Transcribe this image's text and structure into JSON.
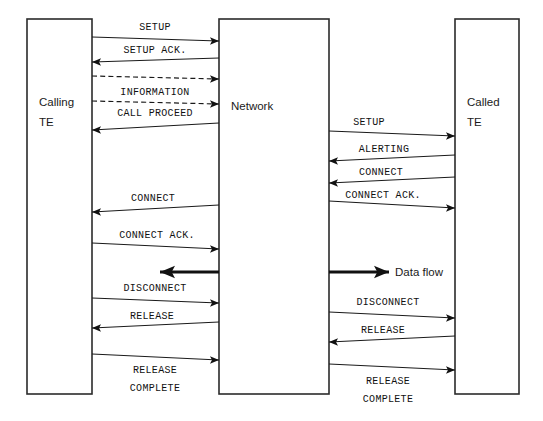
{
  "diagram": {
    "colors": {
      "line": "#1a1a1a",
      "box_stroke": "#2b2b2b",
      "background": "#ffffff",
      "bold_arrow": "#111111"
    },
    "nodes": [
      {
        "id": "calling",
        "label_line1": "Calling",
        "label_line2": "TE",
        "x": 27,
        "y": 19,
        "w": 65,
        "h": 375
      },
      {
        "id": "network",
        "label_line1": "Network",
        "label_line2": "",
        "x": 219,
        "y": 19,
        "w": 110,
        "h": 375
      },
      {
        "id": "called",
        "label_line1": "Called",
        "label_line2": "TE",
        "x": 455,
        "y": 19,
        "w": 64,
        "h": 375
      }
    ],
    "messages": [
      {
        "id": "m1",
        "label": "SETUP",
        "side": "left",
        "direction": "right",
        "style": "solid",
        "label_x": 155,
        "label_y": 30,
        "x1": 92,
        "y1": 37,
        "x2": 219,
        "y2": 41
      },
      {
        "id": "m2",
        "label": "SETUP ACK.",
        "side": "left",
        "direction": "left",
        "style": "solid",
        "label_x": 155,
        "label_y": 53,
        "x1": 219,
        "y1": 58,
        "x2": 92,
        "y2": 62
      },
      {
        "id": "m3",
        "label": "",
        "side": "left",
        "direction": "right",
        "style": "dashed",
        "label_x": 0,
        "label_y": 0,
        "x1": 92,
        "y1": 76,
        "x2": 219,
        "y2": 79
      },
      {
        "id": "m4",
        "label": "INFORMATION",
        "side": "left",
        "direction": "none",
        "style": "none",
        "label_x": 155,
        "label_y": 95,
        "x1": 0,
        "y1": 0,
        "x2": 0,
        "y2": 0
      },
      {
        "id": "m5",
        "label": "",
        "side": "left",
        "direction": "right",
        "style": "dashed",
        "label_x": 0,
        "label_y": 0,
        "x1": 92,
        "y1": 101,
        "x2": 219,
        "y2": 104
      },
      {
        "id": "m6",
        "label": "CALL PROCEED",
        "side": "left",
        "direction": "left",
        "style": "solid",
        "label_x": 155,
        "label_y": 116,
        "x1": 219,
        "y1": 123,
        "x2": 92,
        "y2": 130
      },
      {
        "id": "m7",
        "label": "SETUP",
        "side": "right",
        "direction": "right",
        "style": "solid",
        "label_x": 369,
        "label_y": 125,
        "x1": 329,
        "y1": 131,
        "x2": 455,
        "y2": 136
      },
      {
        "id": "m8",
        "label": "ALERTING",
        "side": "right",
        "direction": "left",
        "style": "solid",
        "label_x": 384,
        "label_y": 152,
        "x1": 455,
        "y1": 155,
        "x2": 329,
        "y2": 161
      },
      {
        "id": "m9",
        "label": "CONNECT",
        "side": "right",
        "direction": "left",
        "style": "solid",
        "label_x": 381,
        "label_y": 175,
        "x1": 455,
        "y1": 177,
        "x2": 329,
        "y2": 183
      },
      {
        "id": "m10",
        "label": "CONNECT",
        "side": "left",
        "direction": "left",
        "style": "solid",
        "label_x": 153,
        "label_y": 201,
        "x1": 219,
        "y1": 205,
        "x2": 92,
        "y2": 212
      },
      {
        "id": "m11",
        "label": "CONNECT ACK.",
        "side": "right",
        "direction": "right",
        "style": "solid",
        "label_x": 383,
        "label_y": 198,
        "x1": 329,
        "y1": 201,
        "x2": 455,
        "y2": 208
      },
      {
        "id": "m12",
        "label": "CONNECT ACK.",
        "side": "left",
        "direction": "right",
        "style": "solid",
        "label_x": 157,
        "label_y": 238,
        "x1": 92,
        "y1": 243,
        "x2": 219,
        "y2": 249
      },
      {
        "id": "m13",
        "label": "DISCONNECT",
        "side": "left",
        "direction": "right",
        "style": "solid",
        "label_x": 155,
        "label_y": 291,
        "x1": 92,
        "y1": 298,
        "x2": 219,
        "y2": 303
      },
      {
        "id": "m14",
        "label": "RELEASE",
        "side": "left",
        "direction": "left",
        "style": "solid",
        "label_x": 152,
        "label_y": 319,
        "x1": 219,
        "y1": 322,
        "x2": 92,
        "y2": 328
      },
      {
        "id": "m15",
        "label": "",
        "side": "left",
        "direction": "right",
        "style": "solid",
        "label_x": 0,
        "label_y": 0,
        "x1": 92,
        "y1": 354,
        "x2": 219,
        "y2": 360
      },
      {
        "id": "m16",
        "label": "RELEASE",
        "side": "left",
        "direction": "none",
        "style": "none",
        "label_x": 155,
        "label_y": 373,
        "x1": 0,
        "y1": 0,
        "x2": 0,
        "y2": 0
      },
      {
        "id": "m17",
        "label": "COMPLETE",
        "side": "left",
        "direction": "none",
        "style": "none",
        "label_x": 155,
        "label_y": 391,
        "x1": 0,
        "y1": 0,
        "x2": 0,
        "y2": 0
      },
      {
        "id": "m18",
        "label": "DISCONNECT",
        "side": "right",
        "direction": "right",
        "style": "solid",
        "label_x": 388,
        "label_y": 305,
        "x1": 329,
        "y1": 312,
        "x2": 455,
        "y2": 318
      },
      {
        "id": "m19",
        "label": "RELEASE",
        "side": "right",
        "direction": "left",
        "style": "solid",
        "label_x": 383,
        "label_y": 333,
        "x1": 455,
        "y1": 336,
        "x2": 329,
        "y2": 342
      },
      {
        "id": "m20",
        "label": "",
        "side": "right",
        "direction": "right",
        "style": "solid",
        "label_x": 0,
        "label_y": 0,
        "x1": 329,
        "y1": 364,
        "x2": 455,
        "y2": 370
      },
      {
        "id": "m21",
        "label": "RELEASE",
        "side": "right",
        "direction": "none",
        "style": "none",
        "label_x": 388,
        "label_y": 384,
        "x1": 0,
        "y1": 0,
        "x2": 0,
        "y2": 0
      },
      {
        "id": "m22",
        "label": "COMPLETE",
        "side": "right",
        "direction": "none",
        "style": "none",
        "label_x": 388,
        "label_y": 402,
        "x1": 0,
        "y1": 0,
        "x2": 0,
        "y2": 0
      }
    ],
    "data_flows": [
      {
        "id": "df-left",
        "label": "",
        "direction": "left",
        "x1": 219,
        "y1": 272,
        "x2": 160,
        "y2": 272,
        "label_x": 0,
        "label_y": 0
      },
      {
        "id": "df-right",
        "label": "Data flow",
        "direction": "right",
        "x1": 329,
        "y1": 272,
        "x2": 389,
        "y2": 272,
        "label_x": 395,
        "label_y": 276
      }
    ]
  }
}
